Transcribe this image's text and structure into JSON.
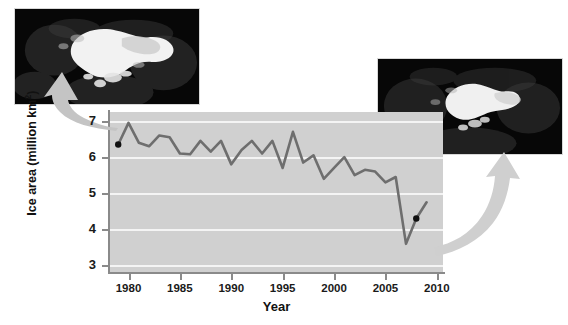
{
  "chart_data": {
    "type": "line",
    "title": "",
    "xlabel": "Year",
    "ylabel": "Ice area (million km2)",
    "ylabel_display": "Ice area (million km",
    "ylabel_sup": "2",
    "ylabel_tail": ")",
    "xlim": [
      1978.2,
      2010.6
    ],
    "ylim": [
      2.82,
      7.25
    ],
    "grid": true,
    "legend": "none",
    "line_color": "#6e6e6e",
    "marker_color": "#111111",
    "plot_bg": "#d0d0d0",
    "gridline_color": "#f4f4f4",
    "x_ticks": [
      1980,
      1985,
      1990,
      1995,
      2000,
      2005,
      2010
    ],
    "x_tick_labels": [
      "1980",
      "1985",
      "1990",
      "1995",
      "2000",
      "2005",
      "2010"
    ],
    "y_ticks": [
      3,
      4,
      5,
      6,
      7
    ],
    "y_tick_labels": [
      "3",
      "4",
      "5",
      "6",
      "7"
    ],
    "x": [
      1979,
      1980,
      1981,
      1982,
      1983,
      1984,
      1985,
      1986,
      1987,
      1988,
      1989,
      1990,
      1991,
      1992,
      1993,
      1994,
      1995,
      1996,
      1997,
      1998,
      1999,
      2000,
      2001,
      2002,
      2003,
      2004,
      2005,
      2006,
      2007,
      2008,
      2009
    ],
    "values": [
      6.35,
      6.95,
      6.4,
      6.3,
      6.6,
      6.55,
      6.1,
      6.08,
      6.45,
      6.15,
      6.45,
      5.8,
      6.2,
      6.45,
      6.1,
      6.45,
      5.7,
      6.7,
      5.85,
      6.05,
      5.4,
      5.7,
      6.0,
      5.5,
      5.65,
      5.6,
      5.3,
      5.45,
      3.6,
      4.3,
      4.75
    ],
    "annotations": [
      {
        "name": "start-point",
        "x": 1979,
        "y": 6.35,
        "label": ""
      },
      {
        "name": "minimum-point",
        "x": 2008,
        "y": 4.3,
        "label": ""
      }
    ]
  },
  "insets": [
    {
      "name": "arctic-sea-ice-1979",
      "alt": "Satellite image of Arctic sea ice extent, large white ice mass",
      "ice_color": "#f2f2f2",
      "bg_color": "#070707"
    },
    {
      "name": "arctic-sea-ice-2007",
      "alt": "Satellite image of Arctic sea ice extent, reduced white ice mass",
      "ice_color": "#f0f0f0",
      "bg_color": "#070707"
    }
  ],
  "arrows": [
    {
      "name": "arrow-to-left-inset",
      "color": "#c4c4c4"
    },
    {
      "name": "arrow-to-right-inset",
      "color": "#cfcfcf"
    }
  ]
}
